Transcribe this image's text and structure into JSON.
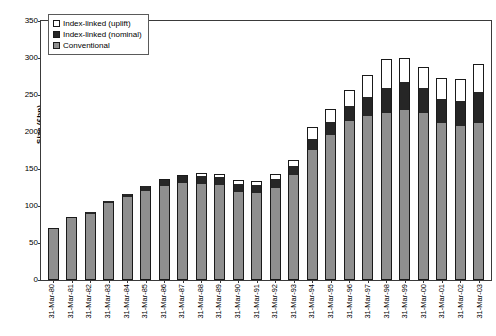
{
  "chart_data": {
    "type": "bar",
    "stacked": true,
    "title": "",
    "xlabel": "",
    "ylabel": "Size (£bn)",
    "ylim": [
      0,
      350
    ],
    "yticks": [
      0,
      50,
      100,
      150,
      200,
      250,
      300,
      350
    ],
    "grid": false,
    "legend_position": "top-left",
    "categories": [
      "31-Mar-80",
      "31-Mar-81",
      "31-Mar-82",
      "31-Mar-83",
      "31-Mar-84",
      "31-Mar-85",
      "31-Mar-86",
      "31-Mar-87",
      "31-Mar-88",
      "31-Mar-89",
      "31-Mar-90",
      "31-Mar-91",
      "31-Mar-92",
      "31-Mar-93",
      "31-Mar-94",
      "31-Mar-95",
      "31-Mar-96",
      "31-Mar-97",
      "31-Mar-98",
      "31-Mar-99",
      "31-Mar-00",
      "31-Mar-01",
      "31-Mar-02",
      "31-Mar-03"
    ],
    "series": [
      {
        "name": "Conventional",
        "color": "#8f8f8f",
        "values": [
          70,
          85,
          89,
          104,
          112,
          120,
          127,
          131,
          130,
          128,
          119,
          117,
          125,
          142,
          176,
          196,
          215,
          222,
          226,
          230,
          226,
          212,
          208,
          212
        ]
      },
      {
        "name": "Index-linked (nominal)",
        "color": "#262626",
        "values": [
          0,
          0,
          3,
          3,
          4,
          7,
          8,
          9,
          10,
          11,
          11,
          11,
          11,
          12,
          15,
          17,
          20,
          26,
          34,
          38,
          33,
          32,
          34,
          42
        ]
      },
      {
        "name": "Index-linked (uplift)",
        "color": "#ffffff",
        "values": [
          0,
          0,
          0,
          0,
          0,
          0,
          1,
          2,
          4,
          4,
          5,
          6,
          7,
          8,
          16,
          18,
          22,
          29,
          39,
          32,
          29,
          29,
          30,
          38
        ]
      }
    ],
    "totals": [
      70,
      85,
      92,
      107,
      116,
      127,
      136,
      142,
      144,
      143,
      135,
      134,
      143,
      162,
      207,
      231,
      257,
      277,
      299,
      300,
      288,
      273,
      272,
      292
    ]
  },
  "legend": {
    "items": [
      {
        "label": "Index-linked (uplift)",
        "swatch": "uplift"
      },
      {
        "label": "Index-linked (nominal)",
        "swatch": "nominal"
      },
      {
        "label": "Conventional",
        "swatch": "conventional"
      }
    ]
  }
}
